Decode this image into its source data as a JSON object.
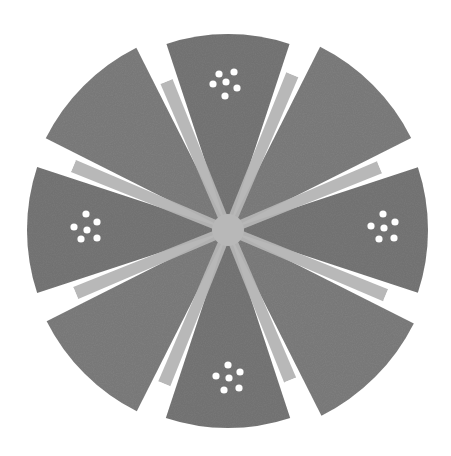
{
  "image": {
    "description": "Circular disk divided into 8 gray wedges separated by radial light bands; four wedges carry a cluster of six white dots",
    "width": 451,
    "height": 456
  },
  "disk": {
    "center": [
      228,
      230
    ],
    "radius": 200,
    "wedge_count": 8,
    "colors": {
      "background": "#ffffff",
      "wedge": "#7f7f7f",
      "wedge_dark": "#787878",
      "band": "#b4b4b4",
      "center_hub": "#b8b8b8",
      "dot": "#ffffff"
    }
  },
  "dot_clusters": [
    {
      "position": "top",
      "dots": [
        [
          219,
          74
        ],
        [
          234,
          72
        ],
        [
          213,
          84
        ],
        [
          226,
          82
        ],
        [
          237,
          88
        ],
        [
          225,
          96
        ]
      ]
    },
    {
      "position": "right",
      "dots": [
        [
          383,
          214
        ],
        [
          371,
          226
        ],
        [
          384,
          228
        ],
        [
          395,
          222
        ],
        [
          379,
          239
        ],
        [
          394,
          238
        ]
      ]
    },
    {
      "position": "bottom",
      "dots": [
        [
          228,
          365
        ],
        [
          216,
          376
        ],
        [
          229,
          378
        ],
        [
          240,
          372
        ],
        [
          224,
          390
        ],
        [
          239,
          388
        ]
      ]
    },
    {
      "position": "left",
      "dots": [
        [
          86,
          214
        ],
        [
          74,
          227
        ],
        [
          87,
          230
        ],
        [
          97,
          222
        ],
        [
          81,
          239
        ],
        [
          97,
          238
        ]
      ]
    }
  ]
}
